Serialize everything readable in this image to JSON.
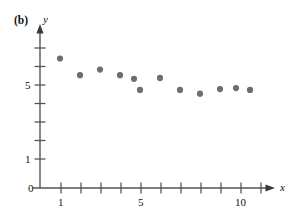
{
  "figure": {
    "panel_label": "(b)",
    "x_axis_label": "x",
    "y_axis_label": "y",
    "origin_label": "0",
    "axis_color": "#555555",
    "point_color": "#6e6e6e",
    "background": "#ffffff"
  },
  "chart_data": {
    "type": "scatter",
    "title": "",
    "subtitle": "",
    "xlabel": "x",
    "ylabel": "y",
    "panel": "(b)",
    "grid": false,
    "legend": null,
    "xlim": [
      0,
      11.8
    ],
    "ylim": [
      0,
      8.0
    ],
    "x_ticks": [
      1,
      2,
      3,
      4,
      5,
      6,
      7,
      8,
      9,
      10,
      11
    ],
    "x_tick_labels": [
      "1",
      "",
      "",
      "",
      "5",
      "",
      "",
      "",
      "",
      "10",
      ""
    ],
    "y_ticks": [
      1,
      2,
      3,
      4,
      5,
      6,
      7
    ],
    "y_tick_labels": [
      "1",
      "",
      "",
      "",
      "5",
      "",
      ""
    ],
    "origin_tick_label": "0",
    "x": [
      1,
      2,
      3,
      4,
      5,
      5,
      6,
      7,
      8,
      9,
      10,
      10.8
    ],
    "y": [
      7.0,
      6.1,
      6.4,
      6.1,
      5.9,
      5.3,
      5.95,
      5.3,
      5.1,
      5.35,
      5.4,
      5.3
    ],
    "points": [
      {
        "x": 1,
        "y": 7.0
      },
      {
        "x": 2,
        "y": 6.1
      },
      {
        "x": 3,
        "y": 6.4
      },
      {
        "x": 4,
        "y": 6.1
      },
      {
        "x": 4.7,
        "y": 5.9
      },
      {
        "x": 5,
        "y": 5.3
      },
      {
        "x": 6,
        "y": 5.95
      },
      {
        "x": 7,
        "y": 5.3
      },
      {
        "x": 8,
        "y": 5.1
      },
      {
        "x": 9,
        "y": 5.35
      },
      {
        "x": 9.8,
        "y": 5.4
      },
      {
        "x": 10.5,
        "y": 5.3
      }
    ]
  }
}
